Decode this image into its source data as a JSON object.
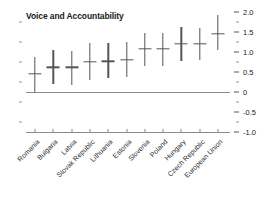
{
  "chart_data": {
    "type": "scatter",
    "title": "Voice and Accountability",
    "xlabel": "",
    "ylabel": "",
    "ylim": [
      -1.0,
      2.0
    ],
    "grid": false,
    "legend": "none",
    "y_ticks": [
      "2.0",
      "1.5",
      "1.0",
      "0.5",
      "0",
      "-0.5",
      "-1.0"
    ],
    "y_tick_values": [
      2.0,
      1.5,
      1.0,
      0.5,
      0,
      -0.5,
      -1.0
    ],
    "categories": [
      "Romania",
      "Bulgaria",
      "Latvia",
      "Slovak Republic",
      "Lithuania",
      "Estonia",
      "Slovenia",
      "Poland",
      "Hungary",
      "Czech Republic",
      "European Union"
    ],
    "values": [
      0.45,
      0.62,
      0.62,
      0.75,
      0.77,
      0.8,
      1.08,
      1.08,
      1.2,
      1.2,
      1.45
    ],
    "low": [
      0.0,
      0.2,
      0.18,
      0.3,
      0.35,
      0.38,
      0.65,
      0.65,
      0.78,
      0.8,
      1.05
    ],
    "high": [
      0.88,
      1.05,
      1.02,
      1.22,
      1.22,
      1.25,
      1.48,
      1.48,
      1.62,
      1.6,
      1.92
    ],
    "series": [
      {
        "name": "Estimate with range",
        "values": [
          0.45,
          0.62,
          0.62,
          0.75,
          0.77,
          0.8,
          1.08,
          1.08,
          1.2,
          1.2,
          1.45
        ]
      }
    ],
    "marker_color": "#555555",
    "axis_color": "#8c8c8c"
  }
}
